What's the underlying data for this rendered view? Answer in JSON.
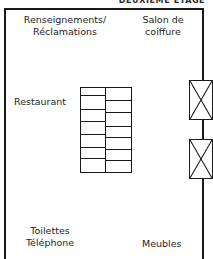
{
  "header": {
    "title": "DEUXIÈME ÉTAGE"
  },
  "rooms": {
    "info": {
      "name": "renseignements-reclamations",
      "lines": [
        "Renseignements/",
        "Réclamations"
      ]
    },
    "salon": {
      "name": "salon-de-coiffure",
      "lines": [
        "Salon de",
        "coiffure"
      ]
    },
    "restaurant": {
      "name": "restaurant",
      "lines": [
        "Restaurant"
      ]
    },
    "toilettes": {
      "name": "toilettes-telephone",
      "lines": [
        "Toilettes",
        "Téléphone"
      ]
    },
    "meubles": {
      "name": "meubles",
      "lines": [
        "Meubles"
      ]
    }
  },
  "restaurant_tables": {
    "columns": 2,
    "left_column_rows": 7,
    "right_column_rows": 7
  },
  "escalators": [
    {
      "id": "escalator-upper",
      "symbol": "x-cross"
    },
    {
      "id": "escalator-lower",
      "symbol": "x-cross"
    }
  ],
  "colors": {
    "wall": "#1a1a1a",
    "text": "#242424",
    "background": "#ffffff"
  }
}
